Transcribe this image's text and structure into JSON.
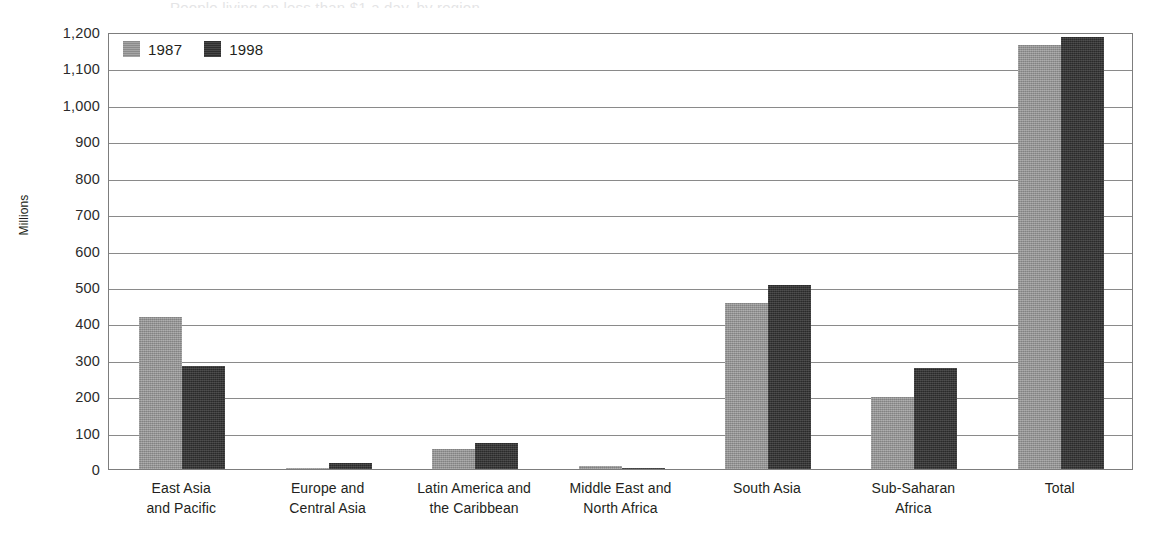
{
  "figure": {
    "title_remnant": "People living on less than $1 a day, by region",
    "y_axis_title": "Millions",
    "legend": [
      {
        "label": "1987",
        "swatch": "legend-swatch-1987",
        "color": "#949494"
      },
      {
        "label": "1998",
        "swatch": "legend-swatch-1998",
        "color": "#333333"
      }
    ]
  },
  "chart_data": {
    "type": "bar",
    "title": "People living on less than $1 a day, by region",
    "xlabel": "",
    "ylabel": "Millions",
    "ylim": [
      0,
      1200
    ],
    "ytick_step": 100,
    "yticks": [
      0,
      100,
      200,
      300,
      400,
      500,
      600,
      700,
      800,
      900,
      1000,
      1100,
      1200
    ],
    "ytick_labels": [
      "0",
      "100",
      "200",
      "300",
      "400",
      "500",
      "600",
      "700",
      "800",
      "900",
      "1,000",
      "1,100",
      "1,200"
    ],
    "grid": true,
    "grid_axis": "y",
    "legend_position": "top-left inside plot area",
    "categories": [
      "East Asia and Pacific",
      "Europe and Central Asia",
      "Latin America and the Caribbean",
      "Middle East and North Africa",
      "South Asia",
      "Sub-Saharan Africa",
      "Total"
    ],
    "category_label_lines": [
      [
        "East Asia",
        "and Pacific"
      ],
      [
        "Europe and",
        "Central Asia"
      ],
      [
        "Latin America and",
        "the Caribbean"
      ],
      [
        "Middle East and",
        "North Africa"
      ],
      [
        "South Asia",
        ""
      ],
      [
        "Sub-Saharan",
        "Africa"
      ],
      [
        "Total",
        ""
      ]
    ],
    "series": [
      {
        "name": "1987",
        "color": "#949494",
        "values": [
          418,
          1,
          54,
          8,
          457,
          199,
          1163
        ]
      },
      {
        "name": "1998",
        "color": "#333333",
        "values": [
          282,
          17,
          72,
          1,
          505,
          278,
          1185
        ]
      }
    ]
  }
}
